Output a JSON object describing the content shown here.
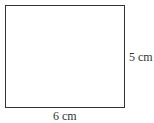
{
  "diagram": {
    "shape": "rectangle",
    "width_label": "6 cm",
    "height_label": "5 cm",
    "stroke_color": "#333333"
  }
}
